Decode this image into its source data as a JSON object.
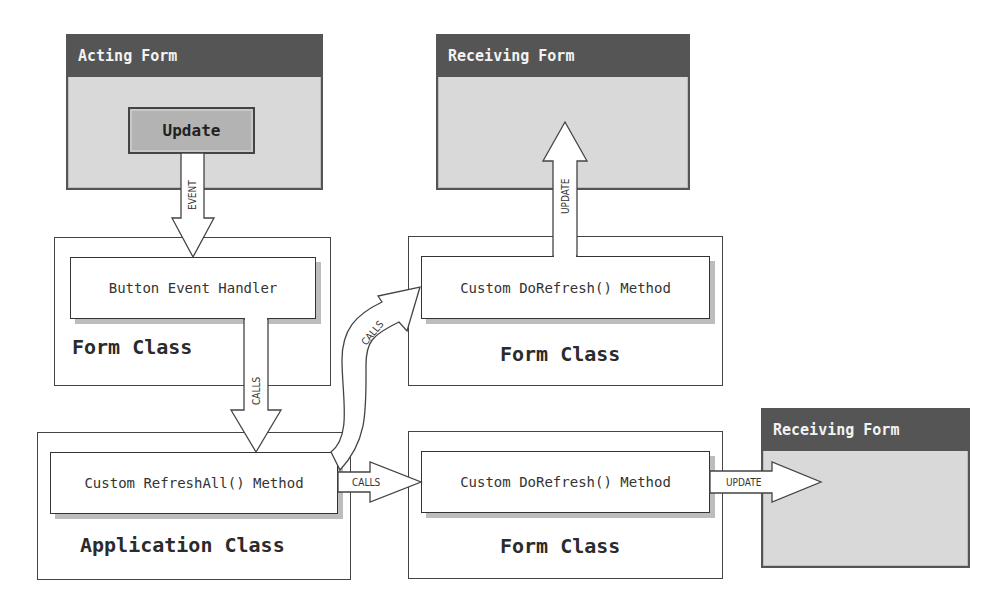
{
  "acting_form": {
    "title": "Acting Form",
    "button_label": "Update"
  },
  "left_column": {
    "handler_method": "Button Event Handler",
    "form_class_label": "Form Class",
    "app_method": "Custom RefreshAll() Method",
    "app_class_label": "Application Class"
  },
  "middle_top": {
    "method": "Custom DoRefresh() Method",
    "class_label": "Form Class"
  },
  "middle_bottom": {
    "method": "Custom DoRefresh() Method",
    "class_label": "Form Class"
  },
  "receiving_forms": [
    {
      "title": "Receiving Form"
    },
    {
      "title": "Receiving Form"
    }
  ],
  "arrows": {
    "event": "EVENT",
    "calls_down": "CALLS",
    "calls_curved": "CALLS",
    "calls_right": "CALLS",
    "update_up": "UPDATE",
    "update_right": "UPDATE"
  },
  "colors": {
    "title_bar": "#555555",
    "form_body": "#d9d9d9",
    "button": "#b3b3b3",
    "shadow": "#bdbdbd",
    "stroke": "#444444"
  }
}
